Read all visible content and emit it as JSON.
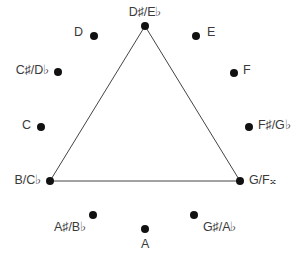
{
  "diagram": {
    "type": "pitch-class-clock",
    "title": "",
    "background_color": "#ffffff",
    "dot_color": "#111111",
    "label_color": "#3a3a3a",
    "line_color": "#444444",
    "width": 296,
    "height": 259,
    "nodes": [
      {
        "id": "node-d-sharp-e-flat",
        "label": "D♯/E♭",
        "dot_x": 145,
        "dot_y": 26,
        "label_x": 145,
        "label_y": 18,
        "label_pos": "above",
        "on_triangle": true
      },
      {
        "id": "node-e",
        "label": "E",
        "dot_x": 196,
        "dot_y": 36,
        "label_x": 207,
        "label_y": 32,
        "label_pos": "right",
        "on_triangle": false
      },
      {
        "id": "node-f",
        "label": "F",
        "dot_x": 234,
        "dot_y": 73,
        "label_x": 243,
        "label_y": 70,
        "label_pos": "right",
        "on_triangle": false
      },
      {
        "id": "node-f-sharp-g-flat",
        "label": "F♯/G♭",
        "dot_x": 249,
        "dot_y": 127,
        "label_x": 258,
        "label_y": 125,
        "label_pos": "right",
        "on_triangle": false
      },
      {
        "id": "node-g-f-double-sharp",
        "label": "G/F𝄪",
        "dot_x": 240,
        "dot_y": 181,
        "label_x": 249,
        "label_y": 180,
        "label_pos": "right",
        "on_triangle": true
      },
      {
        "id": "node-g-sharp-a-flat",
        "label": "G♯/A♭",
        "dot_x": 194,
        "dot_y": 215,
        "label_x": 203,
        "label_y": 227,
        "label_pos": "right",
        "on_triangle": false
      },
      {
        "id": "node-a",
        "label": "A",
        "dot_x": 145,
        "dot_y": 229,
        "label_x": 145,
        "label_y": 238,
        "label_pos": "below",
        "on_triangle": false
      },
      {
        "id": "node-a-sharp-b-flat",
        "label": "A♯/B♭",
        "dot_x": 93,
        "dot_y": 215,
        "label_x": 86,
        "label_y": 227,
        "label_pos": "left",
        "on_triangle": false
      },
      {
        "id": "node-b-c-flat",
        "label": "B/C♭",
        "dot_x": 50,
        "dot_y": 181,
        "label_x": 41,
        "label_y": 180,
        "label_pos": "left",
        "on_triangle": true
      },
      {
        "id": "node-c",
        "label": "C",
        "dot_x": 41,
        "dot_y": 127,
        "label_x": 31,
        "label_y": 125,
        "label_pos": "left",
        "on_triangle": false
      },
      {
        "id": "node-c-sharp-d-flat",
        "label": "C♯/D♭",
        "dot_x": 58,
        "dot_y": 72,
        "label_x": 49,
        "label_y": 70,
        "label_pos": "left",
        "on_triangle": false
      },
      {
        "id": "node-d",
        "label": "D",
        "dot_x": 94,
        "dot_y": 36,
        "label_x": 83,
        "label_y": 32,
        "label_pos": "left",
        "on_triangle": false
      }
    ],
    "triangle": {
      "name": "augmented-triad-triangle",
      "vertices": [
        {
          "x": 145,
          "y": 26
        },
        {
          "x": 240,
          "y": 181
        },
        {
          "x": 50,
          "y": 181
        }
      ],
      "stroke_width": 1
    }
  }
}
